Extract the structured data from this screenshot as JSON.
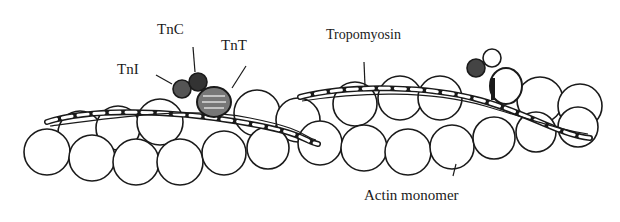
{
  "diagram": {
    "type": "scientific-illustration",
    "labels": {
      "tni": "TnI",
      "tnc": "TnC",
      "tnt": "TnT",
      "tropomyosin": "Tropomyosin",
      "actin": "Actin monomer"
    },
    "components": [
      {
        "name": "troponin complex",
        "parts": [
          "TnI",
          "TnC",
          "TnT"
        ],
        "count": 2
      },
      {
        "name": "tropomyosin",
        "form": "twisted strand along filament",
        "count": 2
      },
      {
        "name": "actin monomer",
        "form": "spherical subunits in double helix"
      }
    ],
    "colors": {
      "ink": "#1a1a1a",
      "background": "#ffffff"
    }
  }
}
